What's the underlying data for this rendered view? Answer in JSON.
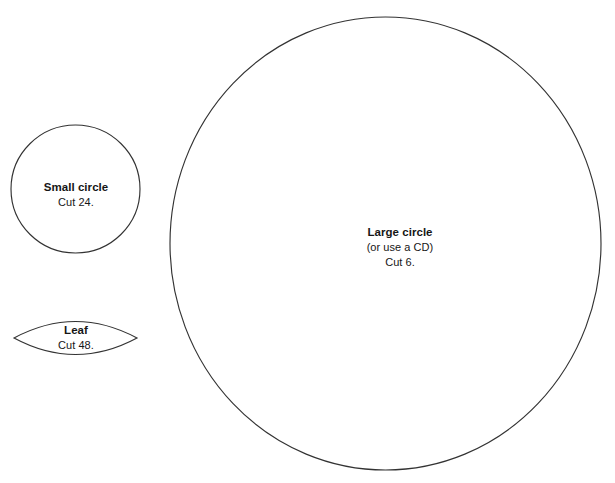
{
  "page": {
    "background_color": "#ffffff",
    "stroke_color": "#333333",
    "text_color": "#161616",
    "width": 615,
    "height": 483
  },
  "shapes": {
    "small_circle": {
      "shape_kind": "circle",
      "title": "Small circle",
      "quantity_note": "Cut 24.",
      "cx": 75.5,
      "cy": 189,
      "rx": 64.5,
      "ry": 64
    },
    "leaf": {
      "shape_kind": "leaf-lens",
      "title": "Leaf",
      "quantity_note": "Cut 48.",
      "left_tip_x": 14,
      "right_tip_x": 137,
      "center_y": 338,
      "half_height": 25
    },
    "large_circle": {
      "shape_kind": "circle",
      "title": "Large circle",
      "alt_note": "(or use a CD)",
      "quantity_note": "Cut 6.",
      "cx": 385.5,
      "cy": 243.5,
      "rx": 215.5,
      "ry": 226.5
    }
  }
}
